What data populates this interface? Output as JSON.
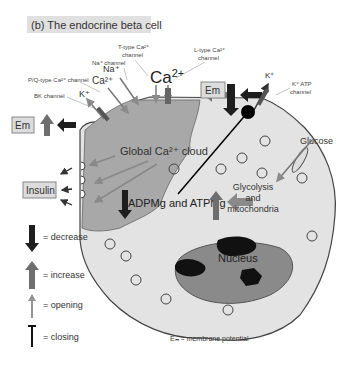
{
  "title": "(b) The endocrine beta cell",
  "ions": {
    "ca_main": "Ca",
    "ca_main_sup": "2+",
    "na": "Na⁺",
    "ca_small": "Ca²⁺",
    "k_left": "K⁺",
    "k_right": "K⁺"
  },
  "channels": {
    "t_type_line1": "T-type Ca²⁺",
    "t_type_line2": "channel",
    "l_type_line1": "L-type Ca²⁺",
    "l_type_line2": "channel",
    "na_channel": "Na⁺ channel",
    "pq_type": "P/Q-type Ca²⁺ channel",
    "bk_channel": "BK channel",
    "katp_line1": "K⁺ ATP",
    "katp_line2": "channel",
    "glut1": "GLUT1"
  },
  "labels": {
    "em_left": "Em",
    "em_right": "Em",
    "insulin": "Insulin",
    "global_ca_cloud": "Global Ca²⁺ cloud",
    "adp_atp": "ADPMg and ATPMg",
    "glucose": "Glucose",
    "glycolysis_line1": "Glycolysis",
    "glycolysis_line2": "and",
    "glycolysis_line3": "mitochondria",
    "nucleus": "Nucleus",
    "em_note": "Eₘ = membrane potential"
  },
  "legend": {
    "items": [
      {
        "icon": "decrease-arrow-icon",
        "label": "= decrease"
      },
      {
        "icon": "increase-arrow-icon",
        "label": "= increase"
      },
      {
        "icon": "opening-arrow-icon",
        "label": "= opening"
      },
      {
        "icon": "closing-icon",
        "label": "= closing"
      }
    ]
  },
  "colors": {
    "cell_fill": "#e3e3e3",
    "cloud_fill": "#a8a8a8",
    "nucleus_fill": "#8a8a8a",
    "decrease": "#1e1e1e",
    "increase": "#6e6e6e",
    "opening": "#949494",
    "box_fill": "#dcdcdc"
  }
}
